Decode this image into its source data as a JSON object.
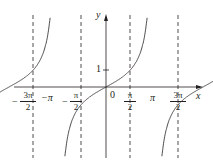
{
  "chart_data": {
    "type": "line",
    "title": "",
    "function": "y = tan x",
    "xlabel": "x",
    "ylabel": "y",
    "x_tick_labels": [
      "-3π/2",
      "-π",
      "-π/2",
      "0",
      "π/2",
      "π",
      "3π/2"
    ],
    "y_tick_labels": [
      "1"
    ],
    "asymptotes": [
      "-3π/2",
      "-π/2",
      "π/2",
      "3π/2"
    ],
    "zeros": [
      "-π",
      "0",
      "π"
    ],
    "grid": false,
    "colors": {
      "curve": "#231f20",
      "axis": "#231f20",
      "asymptote": "#231f20"
    }
  },
  "labels": {
    "y_axis": "y",
    "x_axis": "x",
    "origin": "0",
    "one": "1",
    "neg_pi": "−π",
    "pi": "π",
    "neg_three_pi_num": "3π",
    "neg_three_pi_den": "2",
    "neg_pi_half_num": "π",
    "neg_pi_half_den": "2",
    "pi_half_num": "π",
    "pi_half_den": "2",
    "three_pi_half_num": "3π",
    "three_pi_half_den": "2",
    "minus": "−"
  }
}
